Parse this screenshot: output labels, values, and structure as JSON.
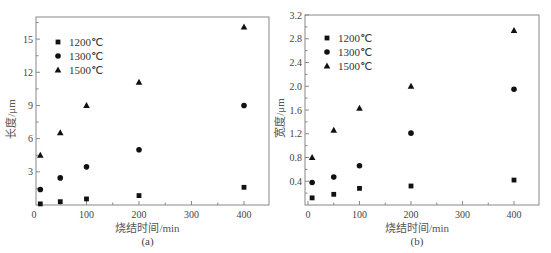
{
  "chart_data": [
    {
      "type": "scatter",
      "panel_label": "(a)",
      "title": "",
      "xlabel": "烧结时间/min",
      "ylabel": "长度/μm",
      "xlim": [
        0,
        450
      ],
      "ylim": [
        0,
        17
      ],
      "xticks": [
        0,
        100,
        200,
        300,
        400
      ],
      "yticks": [
        3,
        6,
        9,
        12,
        15
      ],
      "grid": false,
      "legend_position": "upper-left",
      "series": [
        {
          "name": "1200℃",
          "marker": "square",
          "x": [
            12,
            50,
            100,
            200,
            400
          ],
          "y": [
            0.1,
            0.3,
            0.55,
            0.85,
            1.6
          ]
        },
        {
          "name": "1300℃",
          "marker": "circle",
          "x": [
            12,
            50,
            100,
            200,
            400
          ],
          "y": [
            1.4,
            2.45,
            3.45,
            5.0,
            9.0
          ]
        },
        {
          "name": "1500℃",
          "marker": "triangle",
          "x": [
            12,
            50,
            100,
            200,
            400
          ],
          "y": [
            4.5,
            6.55,
            9.0,
            11.1,
            16.1
          ]
        }
      ]
    },
    {
      "type": "scatter",
      "panel_label": "(b)",
      "title": "",
      "xlabel": "烧结时间/min",
      "ylabel": "宽度/μm",
      "xlim": [
        0,
        450
      ],
      "ylim": [
        0,
        3.2
      ],
      "xticks": [
        0,
        100,
        200,
        300,
        400
      ],
      "yticks": [
        0.4,
        0.8,
        1.2,
        1.6,
        2.0,
        2.4,
        2.8,
        3.2
      ],
      "grid": false,
      "legend_position": "upper-left",
      "series": [
        {
          "name": "1200℃",
          "marker": "square",
          "x": [
            8,
            50,
            100,
            200,
            400
          ],
          "y": [
            0.12,
            0.18,
            0.28,
            0.32,
            0.42
          ]
        },
        {
          "name": "1300℃",
          "marker": "circle",
          "x": [
            8,
            50,
            100,
            200,
            400
          ],
          "y": [
            0.38,
            0.47,
            0.66,
            1.21,
            1.95
          ]
        },
        {
          "name": "1500℃",
          "marker": "triangle",
          "x": [
            8,
            50,
            100,
            200,
            400
          ],
          "y": [
            0.8,
            1.26,
            1.63,
            2.0,
            2.94
          ]
        }
      ]
    }
  ],
  "panels": [
    {
      "panel_label": "(a)",
      "xlabel": "烧结时间/min",
      "ylabel": "长度/μm",
      "xtick_labels": [
        "0",
        "100",
        "200",
        "300",
        "400"
      ],
      "ytick_labels": [
        "3",
        "6",
        "9",
        "12",
        "15"
      ],
      "legend": [
        "1200℃",
        "1300℃",
        "1500℃"
      ]
    },
    {
      "panel_label": "(b)",
      "xlabel": "烧结时间/min",
      "ylabel": "宽度/μm",
      "xtick_labels": [
        "0",
        "100",
        "200",
        "300",
        "400"
      ],
      "ytick_labels": [
        "0.4",
        "0.8",
        "1.2",
        "1.6",
        "2.0",
        "2.4",
        "2.8",
        "3.2"
      ],
      "legend": [
        "1200℃",
        "1300℃",
        "1500℃"
      ]
    }
  ],
  "colors": {
    "marker": "#111111",
    "axis": "#888888",
    "text": "#444444"
  }
}
